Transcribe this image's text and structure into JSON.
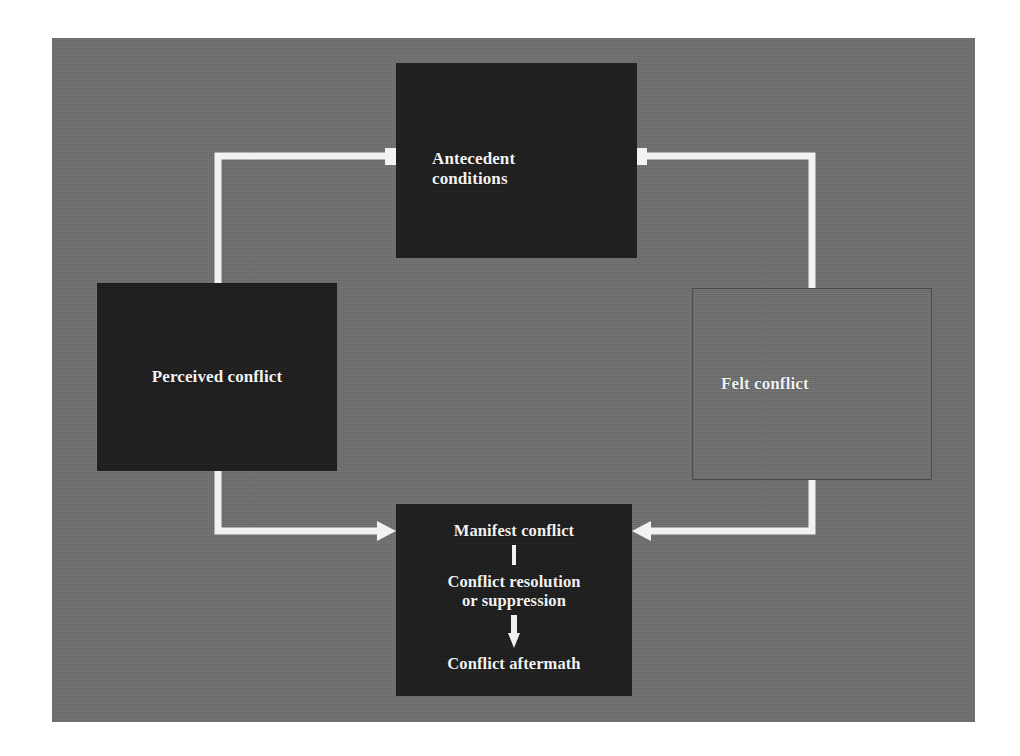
{
  "diagram": {
    "background_color": "#6e6e6e",
    "box_dark_color": "#1d1d1d",
    "connector_color": "#f2f2f2",
    "text_color": "#f2f2f2",
    "nodes": [
      {
        "id": "antecedent",
        "label": "Antecedent\nconditions",
        "style": "dark",
        "align": "left"
      },
      {
        "id": "perceived",
        "label": "Perceived conflict",
        "style": "dark",
        "align": "center"
      },
      {
        "id": "felt",
        "label": "Felt conflict",
        "style": "outline",
        "align": "left"
      },
      {
        "id": "manifest",
        "style": "dark",
        "align": "center",
        "lines": [
          "Manifest conflict",
          "Conflict resolution\nor suppression",
          "Conflict aftermath"
        ]
      }
    ],
    "connectors": [
      {
        "id": "antecedent-to-perceived",
        "from": "antecedent",
        "to": "perceived",
        "arrowhead": false,
        "endpoint_marker": "square-nub"
      },
      {
        "id": "antecedent-to-felt",
        "from": "antecedent",
        "to": "felt",
        "arrowhead": false,
        "endpoint_marker": "square-nub"
      },
      {
        "id": "perceived-to-manifest",
        "from": "perceived",
        "to": "manifest",
        "arrowhead": true,
        "direction": "right"
      },
      {
        "id": "felt-to-manifest",
        "from": "felt",
        "to": "manifest",
        "arrowhead": true,
        "direction": "left"
      },
      {
        "id": "manifest-internal-tick",
        "from": "manifest-conflict",
        "to": "conflict-resolution",
        "arrowhead": false
      },
      {
        "id": "resolution-to-aftermath",
        "from": "conflict-resolution",
        "to": "conflict-aftermath",
        "arrowhead": true,
        "direction": "down"
      }
    ]
  }
}
